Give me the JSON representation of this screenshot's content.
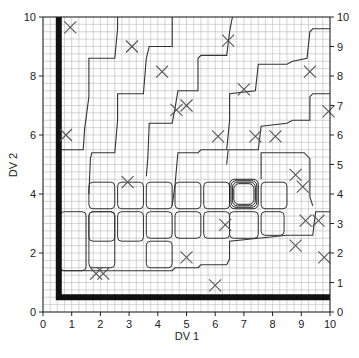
{
  "chart_data": {
    "type": "scatter",
    "title": "",
    "xlabel": "DV 1",
    "ylabel": "DV 2",
    "xlim": [
      0,
      10
    ],
    "ylim": [
      0,
      10
    ],
    "x_ticks": [
      0,
      1,
      2,
      3,
      4,
      5,
      6,
      7,
      8,
      9,
      10
    ],
    "y_ticks_left": [
      0,
      2,
      4,
      6,
      8,
      10
    ],
    "y_ticks_right": [
      0,
      1,
      2,
      3,
      4,
      5,
      6,
      7,
      8,
      9,
      10
    ],
    "grid": true,
    "grid_minor_step": 0.25,
    "legend": null,
    "marker": "x",
    "points": [
      {
        "x": 0.95,
        "y": 9.65
      },
      {
        "x": 3.1,
        "y": 9.0
      },
      {
        "x": 6.45,
        "y": 9.2
      },
      {
        "x": 4.15,
        "y": 8.15
      },
      {
        "x": 9.3,
        "y": 8.15
      },
      {
        "x": 7.0,
        "y": 7.55
      },
      {
        "x": 4.65,
        "y": 6.85
      },
      {
        "x": 5.0,
        "y": 7.0
      },
      {
        "x": 9.95,
        "y": 6.8
      },
      {
        "x": 0.8,
        "y": 6.0
      },
      {
        "x": 6.1,
        "y": 5.95
      },
      {
        "x": 7.4,
        "y": 5.95
      },
      {
        "x": 8.1,
        "y": 5.95
      },
      {
        "x": 2.95,
        "y": 4.4
      },
      {
        "x": 8.8,
        "y": 4.65
      },
      {
        "x": 9.05,
        "y": 4.25
      },
      {
        "x": 6.35,
        "y": 2.95
      },
      {
        "x": 9.15,
        "y": 3.1
      },
      {
        "x": 9.6,
        "y": 3.1
      },
      {
        "x": 5.0,
        "y": 1.85
      },
      {
        "x": 8.8,
        "y": 2.25
      },
      {
        "x": 9.8,
        "y": 1.85
      },
      {
        "x": 6.0,
        "y": 0.9
      },
      {
        "x": 1.85,
        "y": 1.3
      },
      {
        "x": 2.1,
        "y": 1.3
      }
    ],
    "boundary": {
      "description": "thick L-shaped boundary",
      "vertical_x": 0.55,
      "horizontal_y": 0.5
    },
    "contours": [
      {
        "name": "step-contour-1",
        "points": [
          [
            0.6,
            5.5
          ],
          [
            1.4,
            5.5
          ],
          [
            1.45,
            6.2
          ],
          [
            1.6,
            7.3
          ],
          [
            1.6,
            8.6
          ],
          [
            2.5,
            8.6
          ],
          [
            2.6,
            9.6
          ],
          [
            2.6,
            10
          ]
        ]
      },
      {
        "name": "step-contour-2",
        "points": [
          [
            1.6,
            4.0
          ],
          [
            1.65,
            5.2
          ],
          [
            1.7,
            5.4
          ],
          [
            2.5,
            5.4
          ],
          [
            2.6,
            6.5
          ],
          [
            2.6,
            7.4
          ],
          [
            3.5,
            7.4
          ],
          [
            3.6,
            8.6
          ],
          [
            3.7,
            9.0
          ],
          [
            4.5,
            9.0
          ],
          [
            4.5,
            10
          ]
        ]
      },
      {
        "name": "step-contour-3",
        "points": [
          [
            3.6,
            4.6
          ],
          [
            3.65,
            5.2
          ],
          [
            3.7,
            6.4
          ],
          [
            4.5,
            6.4
          ],
          [
            4.6,
            6.9
          ],
          [
            4.7,
            7.5
          ],
          [
            5.4,
            7.5
          ],
          [
            5.4,
            8.6
          ],
          [
            5.5,
            8.7
          ],
          [
            6.4,
            8.7
          ],
          [
            6.5,
            9.5
          ],
          [
            6.6,
            10
          ]
        ]
      },
      {
        "name": "step-contour-4",
        "points": [
          [
            4.5,
            3.6
          ],
          [
            4.6,
            4.3
          ],
          [
            4.7,
            5.4
          ],
          [
            5.4,
            5.4
          ],
          [
            5.5,
            5.5
          ],
          [
            6.4,
            5.5
          ],
          [
            6.5,
            6.5
          ],
          [
            6.5,
            7.4
          ],
          [
            7.4,
            7.5
          ],
          [
            7.5,
            8.4
          ],
          [
            8.5,
            8.4
          ],
          [
            8.7,
            8.5
          ],
          [
            9.2,
            8.6
          ],
          [
            9.3,
            9.5
          ],
          [
            9.4,
            9.6
          ],
          [
            10,
            9.6
          ]
        ]
      },
      {
        "name": "step-contour-5",
        "points": [
          [
            6.4,
            5.0
          ],
          [
            6.45,
            5.5
          ],
          [
            7.5,
            5.5
          ],
          [
            7.6,
            6.3
          ],
          [
            8.5,
            6.4
          ],
          [
            8.7,
            6.5
          ],
          [
            9.3,
            6.5
          ],
          [
            9.3,
            7.3
          ],
          [
            9.4,
            7.4
          ],
          [
            10,
            7.4
          ]
        ]
      }
    ],
    "center_rings": {
      "x": [
        6.5,
        7.5
      ],
      "y": [
        3.5,
        4.5
      ],
      "rings": 4
    }
  }
}
